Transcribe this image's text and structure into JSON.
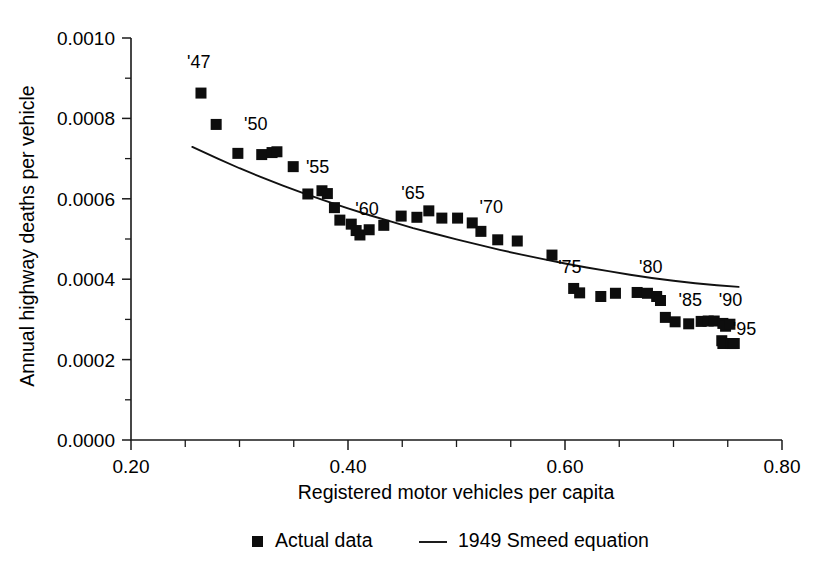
{
  "chart_data": {
    "type": "scatter",
    "title": "",
    "xlabel": "Registered motor vehicles per capita",
    "ylabel": "Annual highway deaths per vehicle",
    "xlim": [
      0.2,
      0.8
    ],
    "ylim": [
      0.0,
      0.001
    ],
    "xticks": [
      "0.20",
      "0.40",
      "0.60",
      "0.80"
    ],
    "xtick_values": [
      0.2,
      0.4,
      0.6,
      0.8
    ],
    "xminor_values": [
      0.25,
      0.3,
      0.35,
      0.45,
      0.5,
      0.55,
      0.65,
      0.7,
      0.75
    ],
    "yticks": [
      "0.0000",
      "0.0002",
      "0.0004",
      "0.0006",
      "0.0008",
      "0.0010"
    ],
    "ytick_values": [
      0.0,
      0.0002,
      0.0004,
      0.0006,
      0.0008,
      0.001
    ],
    "yminor_values": [
      0.0001,
      0.0003,
      0.0005,
      0.0007,
      0.0009
    ],
    "grid": false,
    "legend_position": "below-axis",
    "marker_color": "#0d0d0d",
    "line_color": "#111111",
    "series": [
      {
        "name": "Actual data",
        "type": "scatter",
        "marker": "square",
        "points": [
          {
            "year": "1947",
            "label": "'47",
            "x": 0.2645,
            "y": 0.000863
          },
          {
            "year": "1948",
            "label": "",
            "x": 0.2785,
            "y": 0.000785
          },
          {
            "year": "1949",
            "label": "",
            "x": 0.2985,
            "y": 0.000713
          },
          {
            "year": "1950",
            "label": "'50",
            "x": 0.3205,
            "y": 0.00071
          },
          {
            "year": "1951",
            "label": "",
            "x": 0.33,
            "y": 0.000715
          },
          {
            "year": "1952",
            "label": "",
            "x": 0.3345,
            "y": 0.000717
          },
          {
            "year": "1953",
            "label": "",
            "x": 0.3495,
            "y": 0.00068
          },
          {
            "year": "1954",
            "label": "",
            "x": 0.363,
            "y": 0.000612
          },
          {
            "year": "1955",
            "label": "'55",
            "x": 0.376,
            "y": 0.00062
          },
          {
            "year": "1956",
            "label": "",
            "x": 0.381,
            "y": 0.000613
          },
          {
            "year": "1957",
            "label": "",
            "x": 0.3875,
            "y": 0.000578
          },
          {
            "year": "1958",
            "label": "",
            "x": 0.3925,
            "y": 0.000547
          },
          {
            "year": "1959",
            "label": "",
            "x": 0.403,
            "y": 0.000537
          },
          {
            "year": "1960",
            "label": "'60",
            "x": 0.4075,
            "y": 0.000521
          },
          {
            "year": "1961",
            "label": "",
            "x": 0.411,
            "y": 0.00051
          },
          {
            "year": "1962",
            "label": "",
            "x": 0.4195,
            "y": 0.000523
          },
          {
            "year": "1963",
            "label": "",
            "x": 0.433,
            "y": 0.000534
          },
          {
            "year": "1964",
            "label": "",
            "x": 0.449,
            "y": 0.000557
          },
          {
            "year": "1965",
            "label": "'65",
            "x": 0.4635,
            "y": 0.000554
          },
          {
            "year": "1966",
            "label": "",
            "x": 0.4745,
            "y": 0.00057
          },
          {
            "year": "1967",
            "label": "",
            "x": 0.4865,
            "y": 0.000552
          },
          {
            "year": "1968",
            "label": "",
            "x": 0.501,
            "y": 0.000552
          },
          {
            "year": "1969",
            "label": "",
            "x": 0.5145,
            "y": 0.00054
          },
          {
            "year": "1970",
            "label": "'70",
            "x": 0.5225,
            "y": 0.000519
          },
          {
            "year": "1971",
            "label": "",
            "x": 0.538,
            "y": 0.000498
          },
          {
            "year": "1972",
            "label": "",
            "x": 0.556,
            "y": 0.000495
          },
          {
            "year": "1973",
            "label": "",
            "x": 0.588,
            "y": 0.00046
          },
          {
            "year": "1974",
            "label": "",
            "x": 0.608,
            "y": 0.000377
          },
          {
            "year": "1975",
            "label": "'75",
            "x": 0.6135,
            "y": 0.000366
          },
          {
            "year": "1976",
            "label": "",
            "x": 0.633,
            "y": 0.000357
          },
          {
            "year": "1977",
            "label": "",
            "x": 0.6465,
            "y": 0.000365
          },
          {
            "year": "1978",
            "label": "",
            "x": 0.6665,
            "y": 0.000367
          },
          {
            "year": "1979",
            "label": "",
            "x": 0.676,
            "y": 0.000365
          },
          {
            "year": "1980",
            "label": "'80",
            "x": 0.6845,
            "y": 0.000357
          },
          {
            "year": "1981",
            "label": "",
            "x": 0.688,
            "y": 0.000347
          },
          {
            "year": "1982",
            "label": "",
            "x": 0.6925,
            "y": 0.000305
          },
          {
            "year": "1983",
            "label": "",
            "x": 0.7015,
            "y": 0.000294
          },
          {
            "year": "1984",
            "label": "",
            "x": 0.714,
            "y": 0.000289
          },
          {
            "year": "1985",
            "label": "'85",
            "x": 0.7255,
            "y": 0.000295
          },
          {
            "year": "1986",
            "label": "",
            "x": 0.732,
            "y": 0.000296
          },
          {
            "year": "1987",
            "label": "",
            "x": 0.7375,
            "y": 0.000296
          },
          {
            "year": "1988",
            "label": "",
            "x": 0.7455,
            "y": 0.00029
          },
          {
            "year": "1989",
            "label": "",
            "x": 0.748,
            "y": 0.000283
          },
          {
            "year": "1990",
            "label": "'90",
            "x": 0.752,
            "y": 0.000288
          },
          {
            "year": "1991",
            "label": "",
            "x": 0.7445,
            "y": 0.000247
          },
          {
            "year": "1992",
            "label": "",
            "x": 0.7455,
            "y": 0.00024
          },
          {
            "year": "1993",
            "label": "",
            "x": 0.753,
            "y": 0.00024
          },
          {
            "year": "1994",
            "label": "",
            "x": 0.7545,
            "y": 0.00024
          },
          {
            "year": "1995",
            "label": "'95",
            "x": 0.756,
            "y": 0.00024
          }
        ]
      },
      {
        "name": "1949 Smeed equation",
        "type": "line",
        "points": [
          {
            "x": 0.2565,
            "y": 0.000729
          },
          {
            "x": 0.28,
            "y": 0.0007
          },
          {
            "x": 0.3,
            "y": 0.000676
          },
          {
            "x": 0.32,
            "y": 0.000654
          },
          {
            "x": 0.34,
            "y": 0.000633
          },
          {
            "x": 0.36,
            "y": 0.000613
          },
          {
            "x": 0.38,
            "y": 0.000594
          },
          {
            "x": 0.4,
            "y": 0.000576
          },
          {
            "x": 0.42,
            "y": 0.000559
          },
          {
            "x": 0.44,
            "y": 0.000543
          },
          {
            "x": 0.46,
            "y": 0.000527
          },
          {
            "x": 0.48,
            "y": 0.000513
          },
          {
            "x": 0.5,
            "y": 0.000499
          },
          {
            "x": 0.52,
            "y": 0.000486
          },
          {
            "x": 0.54,
            "y": 0.000473
          },
          {
            "x": 0.56,
            "y": 0.000461
          },
          {
            "x": 0.58,
            "y": 0.00045
          },
          {
            "x": 0.6,
            "y": 0.000439
          },
          {
            "x": 0.62,
            "y": 0.000429
          },
          {
            "x": 0.64,
            "y": 0.00042
          },
          {
            "x": 0.66,
            "y": 0.000411
          },
          {
            "x": 0.68,
            "y": 0.000403
          },
          {
            "x": 0.7,
            "y": 0.000396
          },
          {
            "x": 0.72,
            "y": 0.00039
          },
          {
            "x": 0.74,
            "y": 0.000385
          },
          {
            "x": 0.76,
            "y": 0.000381
          }
        ]
      }
    ],
    "annotations": [
      {
        "label": "'47",
        "x": 0.2625,
        "y": 0.000925
      },
      {
        "label": "'50",
        "x": 0.315,
        "y": 0.000772
      },
      {
        "label": "'55",
        "x": 0.372,
        "y": 0.000665
      },
      {
        "label": "'60",
        "x": 0.4175,
        "y": 0.00056
      },
      {
        "label": "'65",
        "x": 0.46,
        "y": 0.0006
      },
      {
        "label": "'70",
        "x": 0.532,
        "y": 0.000565
      },
      {
        "label": "'75",
        "x": 0.6045,
        "y": 0.000415
      },
      {
        "label": "'80",
        "x": 0.679,
        "y": 0.000415
      },
      {
        "label": "'85",
        "x": 0.7155,
        "y": 0.000333
      },
      {
        "label": "'90",
        "x": 0.7525,
        "y": 0.000333
      },
      {
        "label": "'95",
        "x": 0.7655,
        "y": 0.00026
      }
    ],
    "legend": [
      {
        "label": "Actual data",
        "marker": "square"
      },
      {
        "label": "1949 Smeed equation",
        "marker": "line"
      }
    ]
  }
}
